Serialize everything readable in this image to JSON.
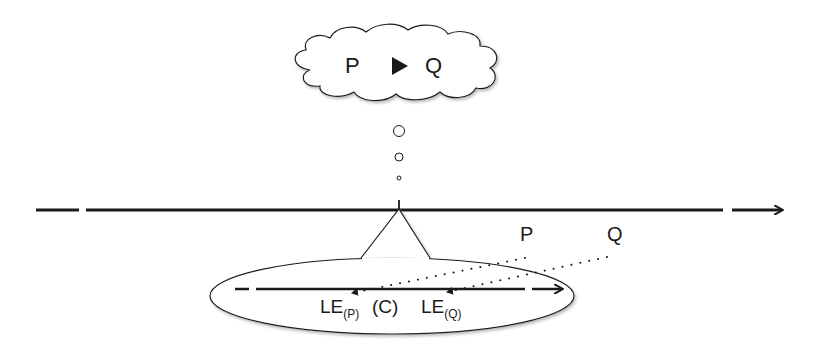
{
  "colors": {
    "stroke": "#1a1a1a",
    "background": "#ffffff",
    "shadow": "#9a9a9a"
  },
  "thought_cloud": {
    "left_label": "P",
    "arrow_symbol": "▶",
    "right_label": "Q"
  },
  "thought_bubbles": [
    {
      "cx": 399,
      "cy": 131,
      "r": 5.5
    },
    {
      "cx": 399,
      "cy": 157,
      "r": 4
    },
    {
      "cx": 399,
      "cy": 178,
      "r": 2
    }
  ],
  "timeline": {
    "direction": "right",
    "has_gap_left": true,
    "has_gap_right": true
  },
  "upper_labels": {
    "p": "P",
    "q": "Q"
  },
  "ellipse_labels": {
    "le_p_main": "LE",
    "le_p_sub": "(P)",
    "c": "(C)",
    "le_q_main": "LE",
    "le_q_sub": "(Q)"
  }
}
